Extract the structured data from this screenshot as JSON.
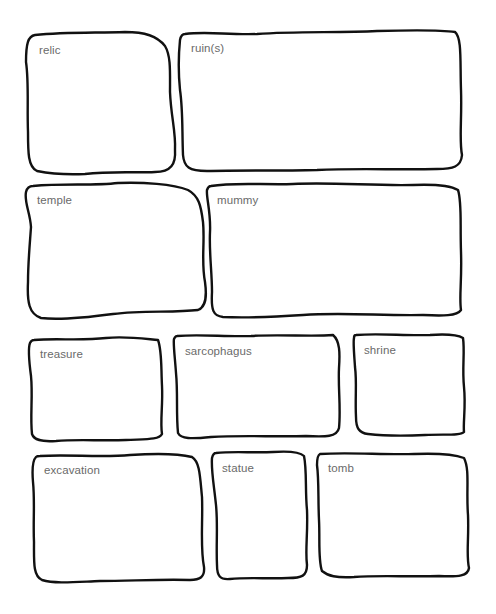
{
  "page": {
    "type": "vocabulary graphic organizer worksheet",
    "background": "#ffffff",
    "border_color": "#111111",
    "label_color": "#6a6a6a"
  },
  "boxes": [
    {
      "id": "relic",
      "label": "relic",
      "x": 25,
      "y": 32,
      "w": 152,
      "h": 143
    },
    {
      "id": "ruins",
      "label": "ruin(s)",
      "x": 177,
      "y": 30,
      "w": 286,
      "h": 142
    },
    {
      "id": "temple",
      "label": "temple",
      "x": 23,
      "y": 182,
      "w": 186,
      "h": 140
    },
    {
      "id": "mummy",
      "label": "mummy",
      "x": 203,
      "y": 182,
      "w": 260,
      "h": 138
    },
    {
      "id": "treasure",
      "label": "treasure",
      "x": 26,
      "y": 336,
      "w": 138,
      "h": 107
    },
    {
      "id": "sarcophagus",
      "label": "sarcophagus",
      "x": 171,
      "y": 333,
      "w": 171,
      "h": 109
    },
    {
      "id": "shrine",
      "label": "shrine",
      "x": 350,
      "y": 332,
      "w": 116,
      "h": 105
    },
    {
      "id": "excavation",
      "label": "excavation",
      "x": 30,
      "y": 452,
      "w": 176,
      "h": 133
    },
    {
      "id": "statue",
      "label": "statue",
      "x": 208,
      "y": 450,
      "w": 102,
      "h": 132
    },
    {
      "id": "tomb",
      "label": "tomb",
      "x": 314,
      "y": 450,
      "w": 156,
      "h": 130
    }
  ]
}
